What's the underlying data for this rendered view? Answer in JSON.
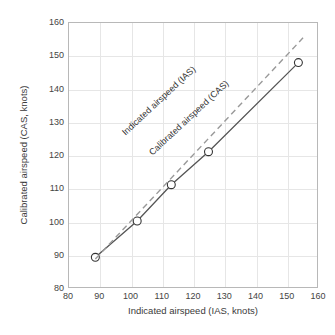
{
  "chart_data": {
    "type": "line",
    "title": "",
    "xlabel": "Indicated airspeed (IAS, knots)",
    "ylabel": "Calibrated airspeed (CAS, knots)",
    "xlim": [
      80,
      160
    ],
    "ylim": [
      80,
      160
    ],
    "xticks": [
      80,
      90,
      100,
      110,
      120,
      130,
      140,
      150,
      160
    ],
    "yticks": [
      80,
      90,
      100,
      110,
      120,
      130,
      140,
      150,
      160
    ],
    "grid": true,
    "legend_position": "inline-annotations",
    "series": [
      {
        "name": "Calibrated airspeed (CAS)",
        "style": "solid",
        "marker": "circle-open",
        "color": "#555555",
        "x": [
          88.5,
          102,
          113,
          125,
          154
        ],
        "y": [
          89,
          100,
          111,
          121,
          148
        ]
      },
      {
        "name": "Indicated airspeed (IAS)",
        "style": "dashed",
        "marker": "none",
        "color": "#999999",
        "x": [
          88.5,
          155.5
        ],
        "y": [
          88.5,
          155.5
        ]
      }
    ],
    "annotations": [
      {
        "text": "Indicated airspeed (IAS)",
        "rotation": -43
      },
      {
        "text": "Calibrated airspeed (CAS)",
        "rotation": -43
      }
    ]
  },
  "axis": {
    "x_tick_labels": [
      "80",
      "90",
      "100",
      "110",
      "120",
      "130",
      "140",
      "150",
      "160"
    ],
    "y_tick_labels": [
      "80",
      "90",
      "100",
      "110",
      "120",
      "130",
      "140",
      "150",
      "160"
    ],
    "x_title": "Indicated airspeed (IAS, knots)",
    "y_title": "Calibrated airspeed (CAS, knots)"
  },
  "colors": {
    "background": "#ffffff",
    "grid": "#e6e6e6",
    "frame": "#b8b8b8",
    "solid_line": "#555555",
    "dashed_line": "#999999",
    "text": "#3a3a3a"
  }
}
